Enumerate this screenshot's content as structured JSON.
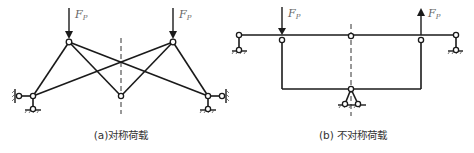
{
  "figure_a": {
    "caption": "(a)对称荷载",
    "loads": [
      {
        "label": "F",
        "subscript": "P",
        "direction": "down"
      },
      {
        "label": "F",
        "subscript": "P",
        "direction": "down"
      }
    ]
  },
  "figure_b": {
    "caption": "(b) 不对称荷载",
    "loads": [
      {
        "label": "F",
        "subscript": "P",
        "direction": "down"
      },
      {
        "label": "F",
        "subscript": "P",
        "direction": "up"
      }
    ]
  },
  "colors": {
    "line": "#1a1a1a",
    "label": "#666666",
    "background": "#ffffff"
  }
}
